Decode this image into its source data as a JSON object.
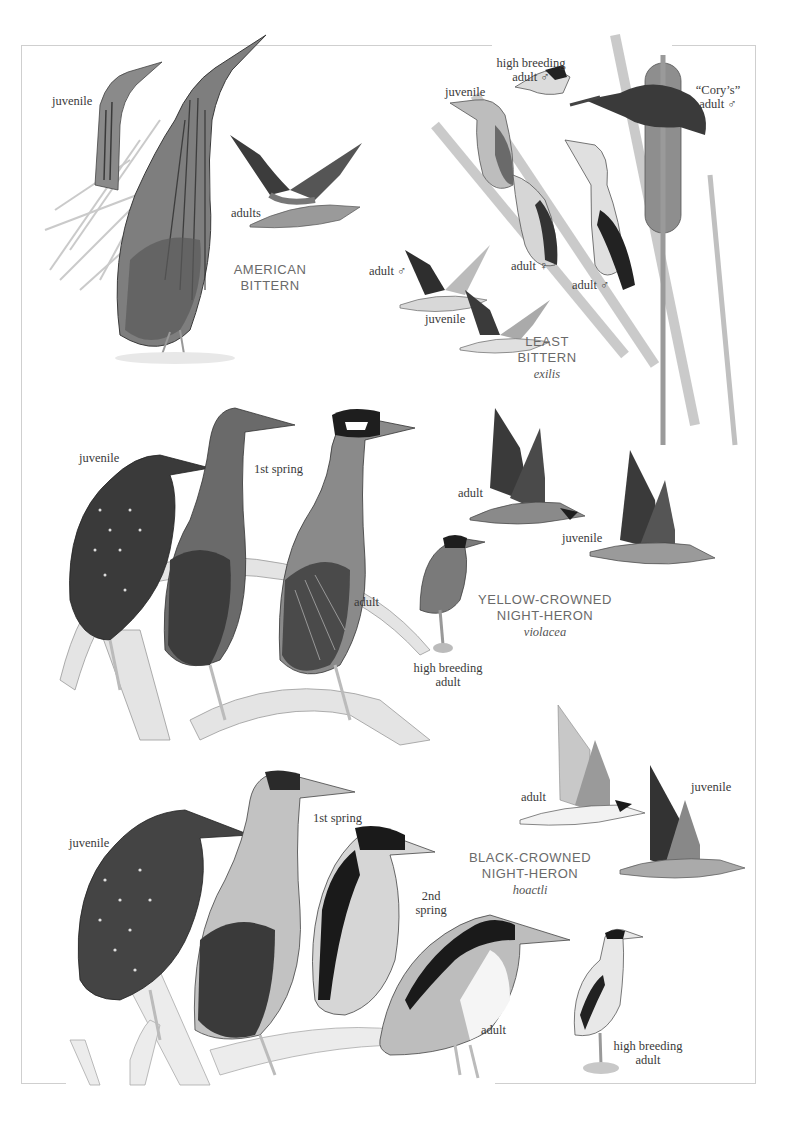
{
  "plate": {
    "sections": [
      {
        "species": "American Bittern",
        "title_lines": [
          "AMERICAN",
          "BITTERN"
        ],
        "scientific": "",
        "labels": [
          "juvenile",
          "adults"
        ]
      },
      {
        "species": "Least Bittern",
        "title_lines": [
          "LEAST",
          "BITTERN"
        ],
        "scientific": "exilis",
        "labels": [
          "high breeding",
          "adult ♂",
          "juvenile",
          "“Cory’s”",
          "adult ♂",
          "adult ♂",
          "juvenile",
          "adult ♀",
          "adult ♂"
        ]
      },
      {
        "species": "Yellow-crowned Night-Heron",
        "title_lines": [
          "YELLOW-CROWNED",
          "NIGHT-HERON"
        ],
        "scientific": "violacea",
        "labels": [
          "juvenile",
          "1st spring",
          "adult",
          "adult",
          "juvenile",
          "high breeding",
          "adult"
        ]
      },
      {
        "species": "Black-crowned Night-Heron",
        "title_lines": [
          "BLACK-CROWNED",
          "NIGHT-HERON"
        ],
        "scientific": "hoactli",
        "labels": [
          "juvenile",
          "1st spring",
          "2nd",
          "spring",
          "adult",
          "juvenile",
          "adult",
          "high breeding",
          "adult"
        ]
      }
    ]
  },
  "colors": {
    "frame": "#cfcfcf",
    "label_text": "#3a3a3a",
    "title_text": "#6a6a6a",
    "bird_dark": "#2b2b2b",
    "bird_mid": "#7a7a7a",
    "bird_light": "#c4c4c4"
  }
}
